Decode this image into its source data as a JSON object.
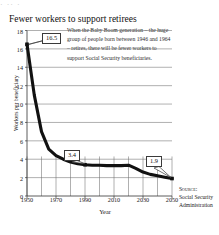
{
  "figure": {
    "top_partial_text": "· ·· ·",
    "title": "Fewer workers to support retirees",
    "annotation": "When the Baby Boom generation – the huge group of people born between 1946 and 1964 – retires, there will be fewer workers to support Social Security beneficiaries.",
    "source_label": "Source:",
    "source_name": "Social Security Administration"
  },
  "chart_data": {
    "type": "line",
    "title": "Fewer workers to support retirees",
    "xlabel": "Year",
    "ylabel": "Workers per beneficiary",
    "xlim": [
      1950,
      2050
    ],
    "ylim": [
      0,
      18
    ],
    "xticks": [
      1950,
      1970,
      1990,
      2010,
      2030,
      2050
    ],
    "yticks": [
      0,
      2,
      4,
      6,
      8,
      10,
      12,
      14,
      16,
      18
    ],
    "grid": "horizontal gridlines at every y tick; vertical gridlines every 10 years in lower band",
    "legend": "none",
    "x": [
      1950,
      1955,
      1960,
      1965,
      1970,
      1975,
      1980,
      1985,
      1990,
      1995,
      2000,
      2005,
      2010,
      2015,
      2020,
      2025,
      2030,
      2035,
      2040,
      2045,
      2050
    ],
    "values": [
      16.5,
      11.0,
      7.0,
      5.1,
      4.4,
      4.0,
      3.7,
      3.5,
      3.4,
      3.35,
      3.35,
      3.3,
      3.3,
      3.3,
      3.35,
      3.0,
      2.6,
      2.35,
      2.2,
      2.05,
      1.9
    ],
    "annotations": [
      {
        "label": "16.5",
        "x": 1950,
        "y": 16.5
      },
      {
        "label": "3.4",
        "x": 1990,
        "y": 3.4
      },
      {
        "label": "1.9",
        "x": 2050,
        "y": 1.9
      }
    ],
    "markers": [
      {
        "x": 1950,
        "y": 16.5
      },
      {
        "x": 1990,
        "y": 3.4
      },
      {
        "x": 2050,
        "y": 1.9
      }
    ]
  },
  "callouts": [
    {
      "label": "16.5"
    },
    {
      "label": "3.4"
    },
    {
      "label": "1.9"
    }
  ]
}
